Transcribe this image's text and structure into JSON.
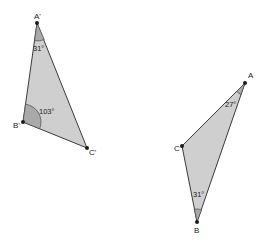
{
  "colors": {
    "fill": "#cfcfcf",
    "angle_fill": "#a9a9a9",
    "stroke": "#3a3a3a",
    "vertex": "#1a1a1a"
  },
  "triangle_prime": {
    "vertices": {
      "A": {
        "label": "A'",
        "x": 37,
        "y": 23
      },
      "B": {
        "label": "B'",
        "x": 23,
        "y": 122
      },
      "C": {
        "label": "C'",
        "x": 87,
        "y": 148
      }
    },
    "angles": {
      "A": {
        "label": "31°"
      },
      "B": {
        "label": "103°"
      }
    }
  },
  "triangle": {
    "vertices": {
      "A": {
        "label": "A",
        "x": 245,
        "y": 83
      },
      "B": {
        "label": "B",
        "x": 197,
        "y": 222
      },
      "C": {
        "label": "C",
        "x": 182,
        "y": 146
      }
    },
    "angles": {
      "A": {
        "label": "27°"
      },
      "B": {
        "label": "31°"
      }
    }
  }
}
